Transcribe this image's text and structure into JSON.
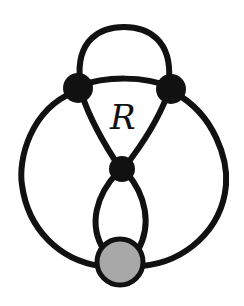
{
  "diagram": {
    "type": "graph",
    "region_label": "R",
    "colors": {
      "edge": "#111111",
      "vertex": "#111111",
      "special_vertex_fill": "#a8a8a8"
    },
    "nodes": [
      {
        "id": "left",
        "kind": "vertex",
        "cx": 78,
        "cy": 88,
        "r": 15
      },
      {
        "id": "right",
        "kind": "vertex",
        "cx": 171,
        "cy": 89,
        "r": 15
      },
      {
        "id": "middle",
        "kind": "vertex",
        "cx": 122,
        "cy": 169,
        "r": 13
      },
      {
        "id": "bottom",
        "kind": "special-vertex",
        "cx": 120,
        "cy": 262,
        "r": 24
      }
    ],
    "edges": [
      {
        "from": "left",
        "to": "right",
        "shape": "top-arc"
      },
      {
        "from": "left",
        "to": "right",
        "shape": "inner-arc"
      },
      {
        "from": "left",
        "to": "middle"
      },
      {
        "from": "right",
        "to": "middle"
      },
      {
        "from": "middle",
        "to": "bottom",
        "shape": "left-loop"
      },
      {
        "from": "middle",
        "to": "bottom",
        "shape": "right-loop"
      },
      {
        "from": "left",
        "to": "bottom",
        "shape": "outer-left-arc"
      },
      {
        "from": "right",
        "to": "bottom",
        "shape": "outer-right-arc"
      }
    ]
  }
}
